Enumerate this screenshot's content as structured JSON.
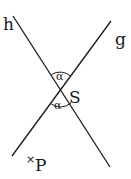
{
  "diagram": {
    "lines": [
      {
        "name": "h",
        "label": "h"
      },
      {
        "name": "g",
        "label": "g"
      }
    ],
    "intersection_label": "S",
    "angles": [
      {
        "position": "top",
        "label": "α"
      },
      {
        "position": "bottom",
        "label": "α"
      }
    ],
    "point": {
      "marker": "×",
      "label": "P"
    },
    "colors": {
      "stroke": "#1a1a1a",
      "background": "#ffffff"
    }
  }
}
